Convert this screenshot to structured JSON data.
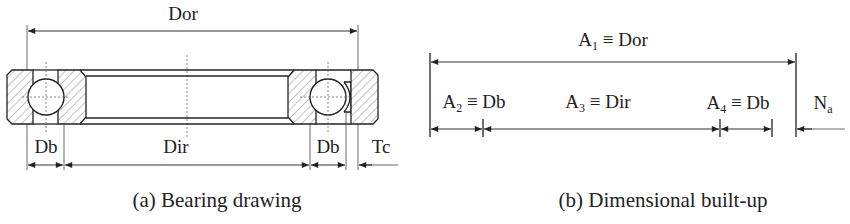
{
  "figure_a": {
    "caption": "(a) Bearing drawing",
    "labels": {
      "outer_diameter": "Dor",
      "inner_diameter": "Dir",
      "ball_diameter_left": "Db",
      "ball_diameter_right": "Db",
      "cage_thickness": "Tc"
    }
  },
  "figure_b": {
    "caption": "(b) Dimensional built-up",
    "labels": {
      "a1": {
        "base": "A",
        "sub": "1",
        "rest": " ≡ Dor"
      },
      "a2": {
        "base": "A",
        "sub": "2",
        "rest": " ≡ Db"
      },
      "a3": {
        "base": "A",
        "sub": "3",
        "rest": " ≡ Dir"
      },
      "a4": {
        "base": "A",
        "sub": "4",
        "rest": " ≡ Db"
      },
      "na": {
        "base": "N",
        "sub": "a"
      }
    }
  }
}
